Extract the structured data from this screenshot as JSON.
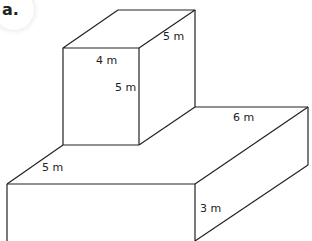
{
  "part_label": "a.",
  "labels": {
    "top_depth": "5 m",
    "top_width": "4 m",
    "top_height": "5 m",
    "base_depth_right": "6 m",
    "base_depth_left": "5 m",
    "base_height": "3 m"
  },
  "colors": {
    "stroke": "#222222",
    "background": "#ffffff"
  }
}
